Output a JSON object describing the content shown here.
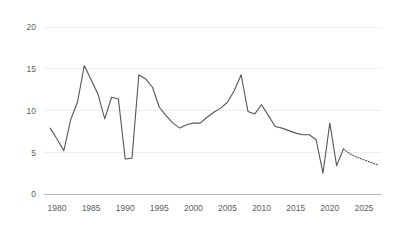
{
  "chart_data": {
    "type": "line",
    "title": "",
    "subtitle": "",
    "xlabel": "",
    "ylabel": "",
    "xlim": [
      1978.5,
      1978.5
    ],
    "ylim": [
      0,
      21
    ],
    "grid": true,
    "legend": "none",
    "y_ticks": [
      "0",
      "5",
      "10",
      "15",
      "20"
    ],
    "y_tick_values": [
      0,
      5,
      10,
      15,
      20
    ],
    "x_ticks": [
      "1980",
      "1985",
      "1990",
      "1995",
      "2000",
      "2005",
      "2010",
      "2015",
      "2020",
      "2025"
    ],
    "x_tick_values": [
      1980,
      1985,
      1990,
      1995,
      2000,
      2005,
      2010,
      2015,
      2020,
      2025
    ],
    "x": [
      1979,
      1980,
      1981,
      1982,
      1983,
      1984,
      1985,
      1986,
      1987,
      1988,
      1989,
      1990,
      1991,
      1992,
      1993,
      1994,
      1995,
      1996,
      1997,
      1998,
      1999,
      2000,
      2001,
      2002,
      2003,
      2004,
      2005,
      2006,
      2007,
      2008,
      2009,
      2010,
      2011,
      2012,
      2013,
      2014,
      2015,
      2016,
      2017,
      2018,
      2019,
      2020,
      2021,
      2022
    ],
    "series": [
      {
        "name": "actual",
        "style": "solid",
        "values": [
          7.9,
          6.6,
          5.2,
          8.9,
          11.0,
          15.4,
          13.7,
          12.0,
          9.0,
          11.6,
          11.4,
          4.2,
          4.3,
          14.3,
          13.8,
          12.8,
          10.4,
          9.4,
          8.5,
          7.9,
          8.3,
          8.5,
          8.5,
          9.2,
          9.8,
          10.3,
          11.0,
          12.4,
          14.3,
          9.9,
          9.6,
          10.7,
          9.4,
          8.1,
          7.9,
          7.6,
          7.3,
          7.1,
          7.1,
          6.5,
          2.5,
          8.5,
          3.4,
          5.4
        ]
      },
      {
        "name": "forecast",
        "style": "dotted",
        "x": [
          2022,
          2023,
          2024,
          2025,
          2026,
          2027
        ],
        "values": [
          5.4,
          4.8,
          4.4,
          4.1,
          3.8,
          3.5
        ]
      }
    ]
  },
  "axes": {
    "y_axis_name": "y-axis",
    "x_axis_name": "x-axis"
  }
}
